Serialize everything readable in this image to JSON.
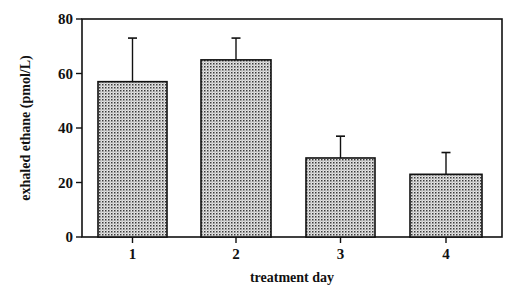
{
  "chart_data": {
    "type": "bar",
    "title": "",
    "xlabel": "treatment day",
    "ylabel": "exhaled ethane (pmol/L)",
    "categories": [
      "1",
      "2",
      "3",
      "4"
    ],
    "values": [
      57,
      65,
      29,
      23
    ],
    "error_upper": [
      73,
      73,
      37,
      31
    ],
    "error_bars": [
      16,
      8,
      8,
      8
    ],
    "ylim": [
      0,
      80
    ],
    "yticks": [
      0,
      20,
      40,
      60,
      80
    ],
    "ytick_labels": [
      "0",
      "20",
      "40",
      "60",
      "80"
    ],
    "grid": false,
    "legend": null,
    "bar_fill": "dotted stipple pattern",
    "colors": {
      "bar_fill": "#cfcfcf",
      "dot": "#3a3a3a",
      "outline": "#111111"
    }
  }
}
